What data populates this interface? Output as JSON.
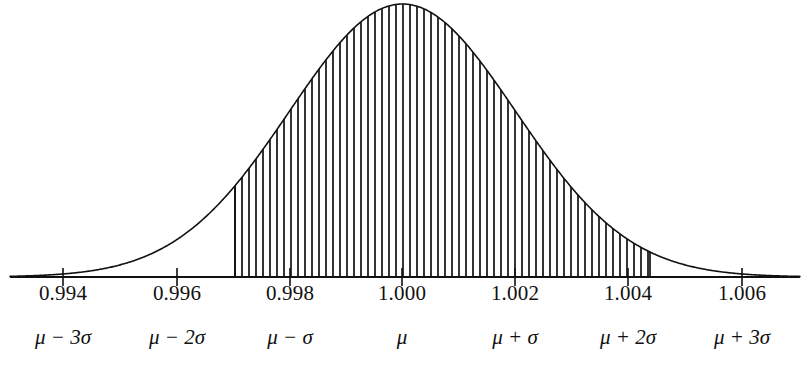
{
  "figure": {
    "title": "",
    "background_color": "#ffffff",
    "ink_color": "#111111"
  },
  "axis": {
    "name": "x-axis",
    "line_y": 277,
    "x_start": 10,
    "x_end": 800,
    "tick_values": [
      0.994,
      0.996,
      0.998,
      1.0,
      1.002,
      1.004,
      1.006
    ],
    "tick_labels": [
      "0.994",
      "0.996",
      "0.998",
      "1.000",
      "1.002",
      "1.004",
      "1.006"
    ],
    "tick_pixel_x": [
      63,
      177,
      290,
      402,
      515,
      628,
      742
    ],
    "sigma_labels": [
      {
        "mu": "μ",
        "op": "−",
        "num": "3",
        "sigma": "σ"
      },
      {
        "mu": "μ",
        "op": "−",
        "num": "2",
        "sigma": "σ"
      },
      {
        "mu": "μ",
        "op": "−",
        "num": "",
        "sigma": "σ"
      },
      {
        "mu": "μ",
        "op": "",
        "num": "",
        "sigma": ""
      },
      {
        "mu": "μ",
        "op": "+",
        "num": "",
        "sigma": "σ"
      },
      {
        "mu": "μ",
        "op": "+",
        "num": "2",
        "sigma": "σ"
      },
      {
        "mu": "μ",
        "op": "+",
        "num": "3",
        "sigma": "σ"
      }
    ],
    "sigma_label_text": [
      "μ − 3σ",
      "μ − 2σ",
      "μ − σ",
      "μ",
      "μ + σ",
      "μ + 2σ",
      "μ + 3σ"
    ]
  },
  "chart_data": {
    "type": "area",
    "title": "",
    "xlabel": "",
    "ylabel": "",
    "distribution": "normal",
    "mean": 1.0,
    "sigma": 0.002,
    "peak_pixel_x": 402,
    "peak_pixel_y": 4,
    "baseline_pixel_y": 277,
    "xlim": [
      0.9931,
      1.0069
    ],
    "ylim": [
      0,
      1
    ],
    "grid": false,
    "legend": null,
    "x": [
      0.993,
      0.9935,
      0.994,
      0.9945,
      0.995,
      0.9955,
      0.996,
      0.9965,
      0.997,
      0.9975,
      0.998,
      0.9985,
      0.999,
      0.9995,
      1.0,
      1.0005,
      1.001,
      1.0015,
      1.002,
      1.0025,
      1.003,
      1.0035,
      1.004,
      1.0045,
      1.005,
      1.0055,
      1.006,
      1.0065,
      1.007
    ],
    "y": [
      0.0004,
      0.0016,
      0.0111,
      0.0439,
      0.1054,
      0.2163,
      0.3247,
      0.4578,
      0.6065,
      0.7548,
      0.8825,
      0.9692,
      1.0,
      0.9692,
      1.0,
      0.9692,
      0.8825,
      0.7548,
      0.6065,
      0.4578,
      0.3247,
      0.2163,
      0.1054,
      0.0439,
      0.0111,
      0.0016,
      0.0004,
      0.0001,
      0.0
    ],
    "shaded_region": {
      "label": "hatched-region",
      "x_from": 0.99703,
      "x_to": 1.00436,
      "pixel_x_from": 235,
      "pixel_x_to": 650,
      "hatch_style": "vertical-lines",
      "hatch_spacing_px": 7,
      "approx_area_fraction": 0.9
    },
    "annotations": []
  }
}
